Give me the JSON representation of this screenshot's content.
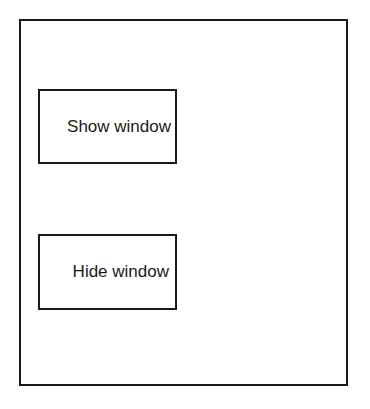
{
  "window": {
    "buttons": [
      {
        "label": "Show window"
      },
      {
        "label": "Hide window"
      }
    ]
  },
  "colors": {
    "stroke": "#1a1a1a",
    "background": "#ffffff"
  }
}
